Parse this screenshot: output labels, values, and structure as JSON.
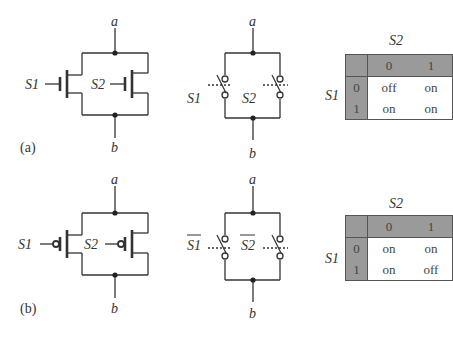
{
  "panels": [
    {
      "id": "a",
      "caption": "(a)",
      "transistor": {
        "node_top": "a",
        "node_bottom": "b",
        "gate1": "S1",
        "gate2": "S2",
        "type": "nMOS"
      },
      "switch": {
        "node_top": "a",
        "node_bottom": "b",
        "ctrl1": "S1",
        "ctrl2": "S2"
      },
      "table": {
        "col_var": "S2",
        "row_var": "S1",
        "col_headers": [
          "0",
          "1"
        ],
        "rows": [
          {
            "header": "0",
            "cells": [
              "off",
              "on"
            ]
          },
          {
            "header": "1",
            "cells": [
              "on",
              "on"
            ]
          }
        ]
      }
    },
    {
      "id": "b",
      "caption": "(b)",
      "transistor": {
        "node_top": "a",
        "node_bottom": "b",
        "gate1": "S1",
        "gate2": "S2",
        "type": "pMOS"
      },
      "switch": {
        "node_top": "a",
        "node_bottom": "b",
        "ctrl1": "S1",
        "ctrl2": "S2",
        "inverted": true
      },
      "table": {
        "col_var": "S2",
        "row_var": "S1",
        "col_headers": [
          "0",
          "1"
        ],
        "rows": [
          {
            "header": "0",
            "cells": [
              "on",
              "on"
            ]
          },
          {
            "header": "1",
            "cells": [
              "on",
              "off"
            ]
          }
        ]
      }
    }
  ],
  "colors": {
    "line": "#333333",
    "table_header_bg": "#9a9a9a"
  }
}
